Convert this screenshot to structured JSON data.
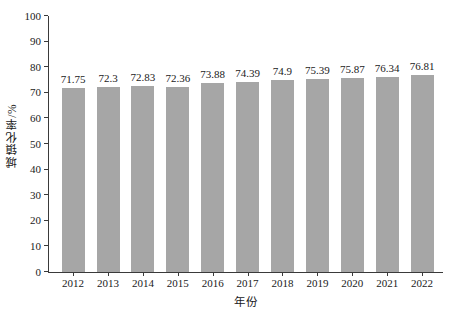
{
  "chart_data": {
    "type": "bar",
    "title": "",
    "subtitle": "",
    "xlabel": "年份",
    "ylabel": "城镇化率/%",
    "categories": [
      "2012",
      "2013",
      "2014",
      "2015",
      "2016",
      "2017",
      "2018",
      "2019",
      "2020",
      "2021",
      "2022"
    ],
    "values": [
      71.75,
      72.3,
      72.83,
      72.36,
      73.88,
      74.39,
      74.9,
      75.39,
      75.87,
      76.34,
      76.81
    ],
    "value_labels": [
      "71.75",
      "72.3",
      "72.83",
      "72.36",
      "73.88",
      "74.39",
      "74.9",
      "75.39",
      "75.87",
      "76.34",
      "76.81"
    ],
    "series": [
      {
        "name": "城镇化率",
        "values": [
          71.75,
          72.3,
          72.83,
          72.36,
          73.88,
          74.39,
          74.9,
          75.39,
          75.87,
          76.34,
          76.81
        ]
      }
    ],
    "ylim": [
      0,
      100
    ],
    "ytick_labels": [
      "0",
      "10",
      "20",
      "30",
      "40",
      "50",
      "60",
      "70",
      "80",
      "90",
      "100"
    ],
    "ytick_values": [
      0,
      10,
      20,
      30,
      40,
      50,
      60,
      70,
      80,
      90,
      100
    ],
    "grid": false,
    "legend": false,
    "legend_position": "none",
    "bar_color": "#a6a6a6",
    "axis_color": "#3a3a3a",
    "background_color": "#ffffff",
    "data_labels_shown": true
  }
}
